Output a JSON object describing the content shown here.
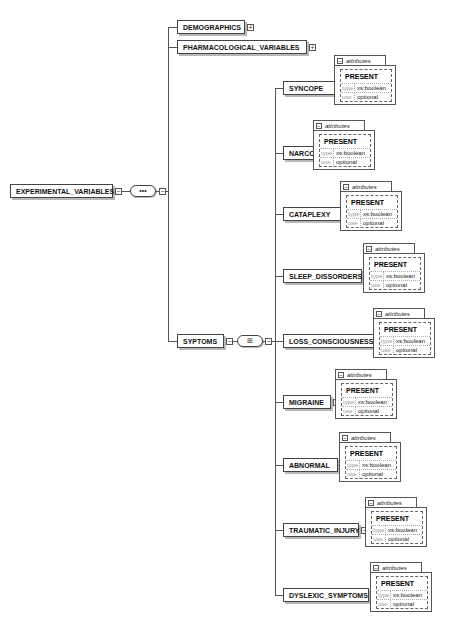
{
  "diagram": {
    "root": {
      "label": "EXPERIMENTAL_VARIABLES",
      "expander": "minus",
      "compositor": "sequence",
      "compositor_glyph": "•••"
    },
    "children": [
      {
        "label": "DEMOGRAPHICS",
        "expander": "plus"
      },
      {
        "label": "PHARMACOLOGICAL_VARIABLES",
        "expander": "plus"
      },
      {
        "label": "SYPTOMS",
        "expander": "minus",
        "compositor": "all",
        "compositor_glyph": "⊞"
      }
    ],
    "attributes_box": {
      "tab_label": "attributes",
      "attribute_name": "PRESENT",
      "rows": [
        {
          "key": "type",
          "value": "xs:boolean"
        },
        {
          "key": "use",
          "value": "optional"
        }
      ]
    },
    "symptoms": [
      {
        "label": "SYNCOPE"
      },
      {
        "label": "NARCOLEPSY"
      },
      {
        "label": "CATAPLEXY"
      },
      {
        "label": "SLEEP_DISSORDERS"
      },
      {
        "label": "LOSS_CONSCIOUSNESS"
      },
      {
        "label": "MIGRAINE"
      },
      {
        "label": "ABNORMAL"
      },
      {
        "label": "TRAUMATIC_INJURY"
      },
      {
        "label": "DYSLEXIC_SYMPTOMS"
      }
    ],
    "expander_glyphs": {
      "plus": "+",
      "minus": "−"
    }
  }
}
